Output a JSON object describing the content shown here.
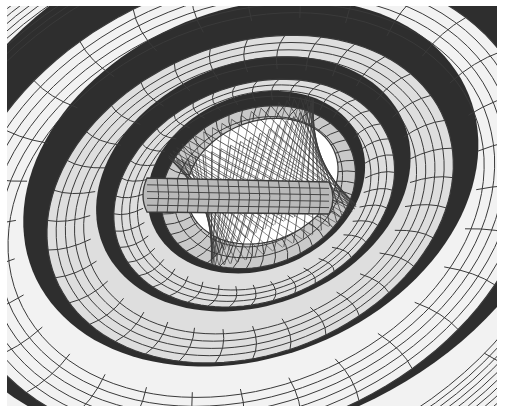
{
  "figure": {
    "palette": {
      "outer_surface": "#f2f2f2",
      "mid_surface": "#dedede",
      "inner_surface": "#c9c9c9",
      "tube_surface": "#b9b9b9",
      "gap_dark": "#2e2e2e",
      "hyperboloid_bg": "#ffffff",
      "grid_line": "#3a3a3a",
      "frame_bg": "#ffffff"
    },
    "center": {
      "x": 235,
      "y": 205
    },
    "rotation_deg": -22,
    "shells": [
      {
        "name": "outer-shell",
        "rx": 420,
        "ry": 330,
        "fill_key": "outer_surface",
        "gap": true,
        "grid_u": 18,
        "grid_v": 14
      },
      {
        "name": "shell-2",
        "rx": 300,
        "ry": 225,
        "fill_key": "outer_surface",
        "gap": true,
        "grid_u": 30,
        "grid_v": 6
      },
      {
        "name": "shell-3",
        "rx": 210,
        "ry": 155,
        "fill_key": "mid_surface",
        "gap": true,
        "grid_u": 34,
        "grid_v": 5
      },
      {
        "name": "shell-4",
        "rx": 145,
        "ry": 108,
        "fill_key": "mid_surface",
        "gap": true,
        "grid_u": 40,
        "grid_v": 4
      },
      {
        "name": "shell-5",
        "rx": 100,
        "ry": 78,
        "fill_key": "inner_surface",
        "gap": true,
        "grid_u": 44,
        "grid_v": 3
      }
    ],
    "hyperboloid": {
      "rx": 78,
      "ry": 60,
      "line_count": 46,
      "twist_deg": 70
    },
    "tube": {
      "x1": 140,
      "x2": 322,
      "y": 190,
      "height": 36,
      "rings": 18,
      "long_lines": 5
    }
  }
}
